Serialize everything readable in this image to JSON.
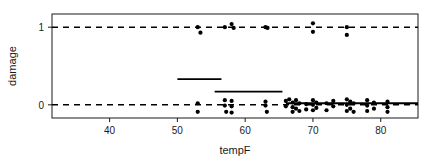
{
  "chart_data": {
    "type": "scatter",
    "title": "",
    "subtitle": "",
    "xlabel": "tempF",
    "ylabel": "damage",
    "xlim": [
      31.5,
      85.5
    ],
    "ylim": [
      -0.17,
      1.17
    ],
    "xticks": [
      40,
      50,
      60,
      70,
      80
    ],
    "xticklabels": [
      "40",
      "50",
      "60",
      "70",
      "80"
    ],
    "yticks": [
      0,
      1
    ],
    "yticklabels": [
      "0",
      "1"
    ],
    "grid": false,
    "legend": null,
    "legend_position": "none",
    "frame": true,
    "series": [
      {
        "name": "damage observations (jittered)",
        "marker": "filled-circle",
        "color": "#000000",
        "points": [
          {
            "x": 53.0,
            "y": 1.0
          },
          {
            "x": 53.4,
            "y": 0.93
          },
          {
            "x": 57.0,
            "y": 1.0
          },
          {
            "x": 58.0,
            "y": 1.04
          },
          {
            "x": 58.3,
            "y": 0.99
          },
          {
            "x": 63.0,
            "y": 1.0
          },
          {
            "x": 63.3,
            "y": 0.99
          },
          {
            "x": 70.0,
            "y": 1.05
          },
          {
            "x": 70.0,
            "y": 0.94
          },
          {
            "x": 75.0,
            "y": 1.0
          },
          {
            "x": 75.0,
            "y": 0.9
          },
          {
            "x": 53.0,
            "y": 0.02
          },
          {
            "x": 53.0,
            "y": -0.09
          },
          {
            "x": 57.0,
            "y": 0.06
          },
          {
            "x": 57.0,
            "y": -0.01
          },
          {
            "x": 57.2,
            "y": -0.09
          },
          {
            "x": 58.0,
            "y": 0.05
          },
          {
            "x": 58.0,
            "y": -0.02
          },
          {
            "x": 58.0,
            "y": -0.1
          },
          {
            "x": 63.0,
            "y": 0.04
          },
          {
            "x": 63.0,
            "y": -0.01
          },
          {
            "x": 63.2,
            "y": -0.09
          },
          {
            "x": 66.0,
            "y": 0.05
          },
          {
            "x": 66.0,
            "y": -0.02
          },
          {
            "x": 66.5,
            "y": 0.07
          },
          {
            "x": 67.0,
            "y": 0.03
          },
          {
            "x": 67.0,
            "y": -0.03
          },
          {
            "x": 67.0,
            "y": -0.09
          },
          {
            "x": 67.5,
            "y": 0.06
          },
          {
            "x": 67.5,
            "y": -0.05
          },
          {
            "x": 68.0,
            "y": 0.02
          },
          {
            "x": 68.0,
            "y": -0.08
          },
          {
            "x": 69.0,
            "y": 0.01
          },
          {
            "x": 69.0,
            "y": -0.06
          },
          {
            "x": 70.0,
            "y": 0.06
          },
          {
            "x": 70.0,
            "y": 0.0
          },
          {
            "x": 70.0,
            "y": -0.07
          },
          {
            "x": 70.5,
            "y": 0.03
          },
          {
            "x": 70.5,
            "y": -0.04
          },
          {
            "x": 72.0,
            "y": 0.02
          },
          {
            "x": 72.0,
            "y": -0.07
          },
          {
            "x": 73.0,
            "y": 0.05
          },
          {
            "x": 73.0,
            "y": -0.02
          },
          {
            "x": 75.0,
            "y": 0.07
          },
          {
            "x": 75.0,
            "y": 0.0
          },
          {
            "x": 75.0,
            "y": -0.08
          },
          {
            "x": 75.5,
            "y": 0.04
          },
          {
            "x": 75.5,
            "y": -0.05
          },
          {
            "x": 76.0,
            "y": 0.02
          },
          {
            "x": 76.0,
            "y": -0.09
          },
          {
            "x": 78.0,
            "y": 0.06
          },
          {
            "x": 78.0,
            "y": -0.01
          },
          {
            "x": 78.0,
            "y": -0.08
          },
          {
            "x": 79.0,
            "y": 0.03
          },
          {
            "x": 79.0,
            "y": -0.05
          },
          {
            "x": 81.0,
            "y": 0.04
          },
          {
            "x": 81.0,
            "y": -0.03
          },
          {
            "x": 81.0,
            "y": -0.09
          }
        ]
      }
    ],
    "reference_lines": [
      {
        "name": "damage-1-reference",
        "y": 1.0,
        "style": "dashed",
        "color": "#000000",
        "x_start": 31.5,
        "x_end": 85.5
      },
      {
        "name": "damage-0-reference",
        "y": 0.0,
        "style": "dashed",
        "color": "#000000",
        "x_start": 31.5,
        "x_end": 85.5
      }
    ],
    "binned_means": [
      {
        "name": "bin-50-55",
        "x_start": 50.0,
        "x_end": 56.5,
        "y": 0.33
      },
      {
        "name": "bin-55-65",
        "x_start": 55.5,
        "x_end": 65.5,
        "y": 0.17
      },
      {
        "name": "bin-65-85",
        "x_start": 66.0,
        "x_end": 85.5,
        "y": 0.02
      }
    ]
  }
}
